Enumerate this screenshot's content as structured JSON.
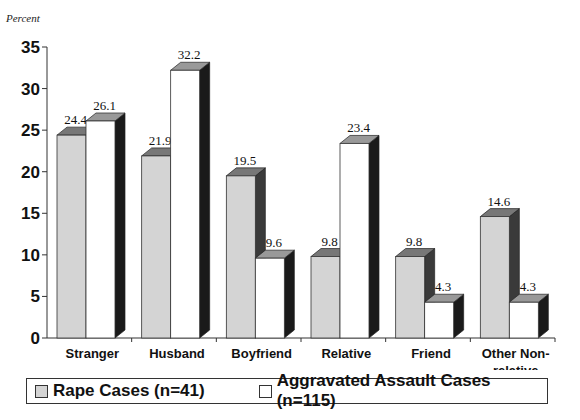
{
  "chart_data": {
    "type": "bar",
    "title": "",
    "ylabel": "Percent",
    "xlabel": "",
    "ylim": [
      0,
      35
    ],
    "yticks": [
      0,
      5,
      10,
      15,
      20,
      25,
      30,
      35
    ],
    "categories": [
      "Stranger",
      "Husband",
      "Boyfriend",
      "Relative",
      "Friend",
      "Other Non-relative"
    ],
    "category_lines": [
      [
        "Stranger"
      ],
      [
        "Husband"
      ],
      [
        "Boyfriend"
      ],
      [
        "Relative"
      ],
      [
        "Friend"
      ],
      [
        "Other Non-",
        "relative"
      ]
    ],
    "series": [
      {
        "name": "Rape Cases (n=41)",
        "values": [
          24.4,
          21.9,
          19.5,
          9.8,
          9.8,
          14.6
        ],
        "color": "#d4d4d4"
      },
      {
        "name": "Aggravated Assault Cases (n=115)",
        "values": [
          26.1,
          32.2,
          9.6,
          23.4,
          4.3,
          4.3
        ],
        "color": "#ffffff"
      }
    ],
    "data_labels": true,
    "grid": false,
    "legend_position": "bottom",
    "style": "3d-bar"
  },
  "legend": {
    "rape": "Rape Cases (n=41)",
    "assault": "Aggravated Assault Cases (n=115)"
  }
}
